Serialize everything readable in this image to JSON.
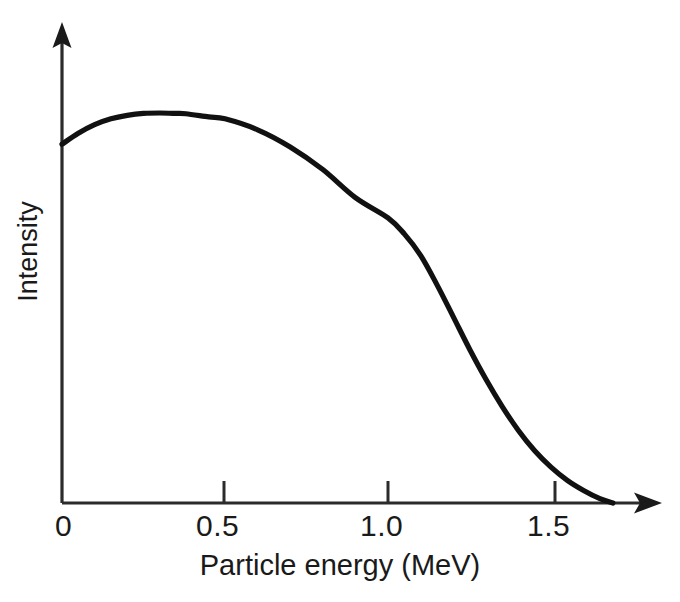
{
  "chart_data": {
    "type": "line",
    "title": "",
    "subtitle": "",
    "xlabel": "Particle energy (MeV)",
    "ylabel": "Intensity",
    "xlim": [
      0,
      1.78
    ],
    "ylim": [
      0,
      1.06
    ],
    "xticks": [
      0,
      0.5,
      1.0,
      1.5
    ],
    "xtick_labels": [
      "0",
      "0.5",
      "1.0",
      "1.5"
    ],
    "yticks": [],
    "ytick_labels": [],
    "grid": false,
    "legend": null,
    "legend_position": "none",
    "annotations": [],
    "axis_style": "arrow-ended open axes",
    "series": [
      {
        "name": "Beta particle intensity spectrum",
        "color": "#111111",
        "x": [
          0.0,
          0.05,
          0.1,
          0.15,
          0.2,
          0.25,
          0.3,
          0.35,
          0.38,
          0.45,
          0.5,
          0.6,
          0.7,
          0.8,
          0.9,
          1.0,
          1.05,
          1.1,
          1.15,
          1.2,
          1.25,
          1.3,
          1.35,
          1.4,
          1.45,
          1.5,
          1.55,
          1.6,
          1.65,
          1.69
        ],
        "y": [
          0.92,
          0.948,
          0.97,
          0.985,
          0.994,
          0.999,
          1.0,
          0.999,
          0.998,
          0.99,
          0.985,
          0.957,
          0.913,
          0.855,
          0.783,
          0.731,
          0.69,
          0.635,
          0.56,
          0.478,
          0.395,
          0.318,
          0.248,
          0.186,
          0.134,
          0.092,
          0.058,
          0.032,
          0.011,
          0.0
        ]
      }
    ]
  },
  "axes": {
    "x_title": "Particle energy (MeV)",
    "y_title": "Intensity",
    "x_tick_labels": [
      "0",
      "0.5",
      "1.0",
      "1.5"
    ]
  },
  "caption": {
    "text": ""
  },
  "colors": {
    "curve": "#111111",
    "axis": "#2b2b2b",
    "background": "#ffffff",
    "text": "#1a1a1a"
  }
}
